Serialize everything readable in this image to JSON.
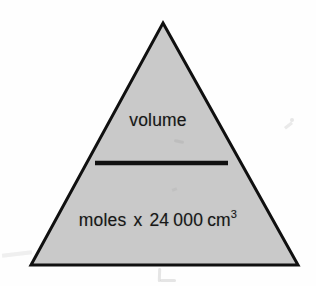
{
  "figure": {
    "kind": "formula-triangle",
    "numerator": "volume",
    "denominator": {
      "quantity": "moles",
      "operator": "x",
      "constant_lead": "24",
      "constant_tail": "000",
      "unit_base": "cm",
      "unit_exponent": "3"
    }
  },
  "colors": {
    "triangle_fill": "#c9c9c9",
    "triangle_stroke": "#101010",
    "divider": "#111111",
    "text": "#171717",
    "background": "#fefefe"
  },
  "geometry": {
    "apex_x": 163,
    "apex_y": 23,
    "base_left_x": 31,
    "base_right_x": 298,
    "base_y": 265,
    "stroke_width": 3,
    "divider_x1": 95,
    "divider_x2": 228,
    "divider_y": 163,
    "divider_thickness": 4
  }
}
